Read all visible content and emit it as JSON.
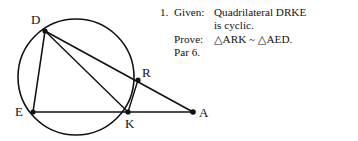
{
  "figure": {
    "name": "cyclic-quadrilateral-drke-diagram",
    "circle": {
      "cx": 76,
      "cy": 77,
      "r": 58,
      "stroke": "#111111"
    },
    "points": [
      {
        "id": "D",
        "label": "D",
        "x": 45,
        "y": 31,
        "label_x": 31,
        "label_y": 24,
        "dot": true
      },
      {
        "id": "E",
        "label": "E",
        "x": 33,
        "y": 112,
        "label_x": 15,
        "label_y": 116,
        "dot": true
      },
      {
        "id": "R",
        "label": "R",
        "x": 138,
        "y": 80,
        "label_x": 142,
        "label_y": 77,
        "dot": true
      },
      {
        "id": "K",
        "label": "K",
        "x": 128,
        "y": 112,
        "label_x": 125,
        "label_y": 128,
        "dot": true
      },
      {
        "id": "A",
        "label": "A",
        "x": 193,
        "y": 112,
        "label_x": 199,
        "label_y": 117,
        "dot": true
      }
    ],
    "segments": [
      {
        "name": "segment-D-A",
        "from": "D",
        "to": "A"
      },
      {
        "name": "segment-D-E",
        "from": "D",
        "to": "E"
      },
      {
        "name": "segment-E-A",
        "from": "E",
        "to": "A"
      },
      {
        "name": "segment-D-K",
        "from": "D",
        "to": "K"
      },
      {
        "name": "segment-R-K",
        "from": "R",
        "to": "K"
      }
    ]
  },
  "problem": {
    "number": "1.",
    "given_label": "Given:",
    "given_text_line1": "Quadrilateral DRKE",
    "given_text_line2": "is cyclic.",
    "prove_label": "Prove:",
    "prove_text": "△ARK ~ △AED.",
    "par_text": "Par 6."
  }
}
